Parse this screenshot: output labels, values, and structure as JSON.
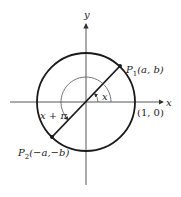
{
  "diagram": {
    "type": "unit-circle",
    "axes": {
      "x_label": "x",
      "y_label": "y"
    },
    "points": [
      {
        "id": "P1",
        "name": "P",
        "subscript": "1",
        "coords": "(a, b)"
      },
      {
        "id": "P2",
        "name": "P",
        "subscript": "2",
        "coords": "(−a,−b)"
      }
    ],
    "angle_labels": {
      "small": "x",
      "large": "x + π"
    },
    "intercept_label": "(1, 0)",
    "colors": {
      "stroke": "#1a1a1a",
      "axis": "#333333",
      "arc": "#555555",
      "background": "#ffffff"
    }
  }
}
